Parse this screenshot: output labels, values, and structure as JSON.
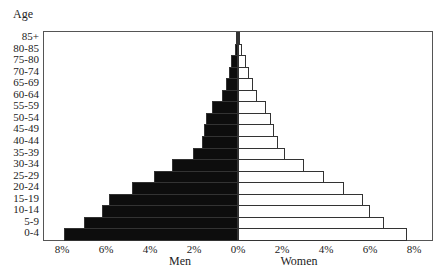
{
  "chart_data": {
    "type": "bar",
    "orientation": "horizontal",
    "subtype": "population-pyramid",
    "title": "",
    "ylabel": "Age",
    "xlabel_left": "Men",
    "xlabel_right": "Women",
    "xlim": [
      -8.5,
      8.5
    ],
    "x_tick_labels": [
      "8%",
      "6%",
      "4%",
      "2%",
      "0%",
      "2%",
      "4%",
      "6%",
      "8%"
    ],
    "x_tick_values": [
      -8,
      -6,
      -4,
      -2,
      0,
      2,
      4,
      6,
      8
    ],
    "grid": false,
    "legend": null,
    "categories": [
      "85+",
      "80-85",
      "75-80",
      "70-74",
      "65-69",
      "60-64",
      "55-59",
      "50-54",
      "45-49",
      "40-44",
      "35-39",
      "30-34",
      "25-29",
      "20-24",
      "15-19",
      "10-14",
      "5-9",
      "0-4"
    ],
    "series": [
      {
        "name": "Men",
        "color": "#0d0d0d",
        "values": [
          0.1,
          0.15,
          0.3,
          0.4,
          0.55,
          0.75,
          1.2,
          1.45,
          1.55,
          1.65,
          2.05,
          3.0,
          3.8,
          4.8,
          5.85,
          6.2,
          7.0,
          7.9
        ]
      },
      {
        "name": "Women",
        "color": "#ffffff",
        "values": [
          0.1,
          0.2,
          0.35,
          0.5,
          0.7,
          0.85,
          1.25,
          1.5,
          1.65,
          1.8,
          2.15,
          3.0,
          3.9,
          4.8,
          5.7,
          6.0,
          6.65,
          7.7
        ]
      }
    ]
  }
}
